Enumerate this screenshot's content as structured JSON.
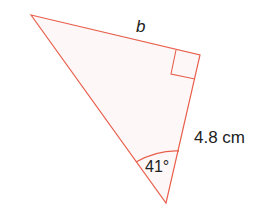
{
  "diagram": {
    "type": "right-triangle",
    "labels": {
      "hypotenuse_side": "b",
      "side_length": "4.8 cm",
      "angle": "41°"
    },
    "colors": {
      "stroke": "#e8604c",
      "fill": "#fdf7f8",
      "text": "#222222"
    }
  }
}
